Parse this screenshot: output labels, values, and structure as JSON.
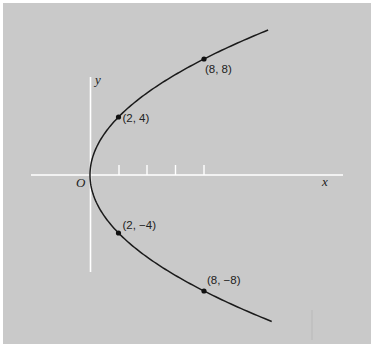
{
  "colors": {
    "page_background": "#ffffff",
    "panel_background": "#c9c9c9",
    "axis": "#ffffff",
    "curve": "#1a1a1a",
    "point": "#111111",
    "label": "#222222"
  },
  "axes": {
    "x_label": "x",
    "y_label": "y",
    "origin_label": "O"
  },
  "points": [
    {
      "label": "(8, 8)",
      "x": 8,
      "y": 8
    },
    {
      "label": "(2, 4)",
      "x": 2,
      "y": 4
    },
    {
      "label": "(2, −4)",
      "x": 2,
      "y": -4
    },
    {
      "label": "(8, −8)",
      "x": 8,
      "y": -8
    }
  ],
  "chart_data": {
    "type": "line",
    "title": "",
    "xlabel": "x",
    "ylabel": "y",
    "equation": "y^2 = 8x",
    "curve": "parabola opening right, vertex at origin O",
    "labeled_points": [
      {
        "x": 8,
        "y": 8,
        "label": "(8, 8)"
      },
      {
        "x": 2,
        "y": 4,
        "label": "(2, 4)"
      },
      {
        "x": 2,
        "y": -4,
        "label": "(2, −4)"
      },
      {
        "x": 8,
        "y": -8,
        "label": "(8, −8)"
      }
    ],
    "x_ticks": [
      2,
      4,
      6,
      8
    ],
    "tick_labels_shown": false,
    "xlim": [
      -4,
      18
    ],
    "ylim": [
      -7,
      7
    ],
    "grid": false,
    "legend": null
  }
}
